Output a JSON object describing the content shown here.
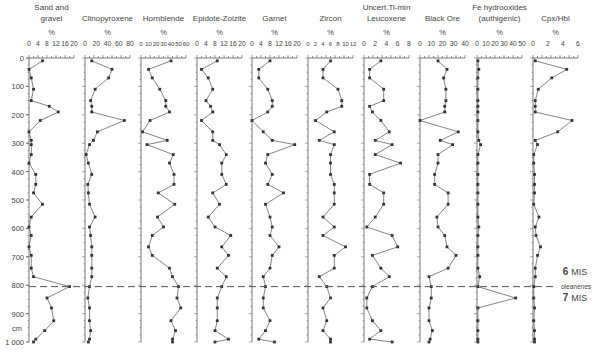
{
  "chart_data": {
    "type": "line",
    "title": "",
    "ylabel": "cm",
    "y_axis": {
      "min": 0,
      "max": 1000,
      "ticks": [
        0,
        100,
        200,
        300,
        400,
        500,
        600,
        700,
        800,
        900,
        "1 000"
      ]
    },
    "depths": [
      10,
      40,
      70,
      110,
      150,
      170,
      190,
      220,
      260,
      290,
      305,
      340,
      370,
      410,
      445,
      475,
      515,
      560,
      595,
      625,
      665,
      695,
      740,
      770,
      805,
      845,
      880,
      925,
      960,
      990,
      1000
    ],
    "panels": [
      {
        "name": "Sand and gravel",
        "title_lines": [
          "Sand and",
          "gravel"
        ],
        "unit": "%",
        "xlim": [
          0,
          20
        ],
        "ticks": [
          "0",
          "4",
          "8",
          "12",
          "16",
          "20"
        ],
        "values": [
          6,
          0,
          1,
          2,
          1,
          9,
          13,
          5,
          0,
          1,
          1,
          1,
          0,
          3,
          3,
          2,
          6,
          1,
          0,
          1,
          0,
          1,
          1,
          2,
          18,
          8,
          10,
          11,
          7,
          3,
          2,
          1
        ]
      },
      {
        "name": "Clinopyroxene",
        "title_lines": [
          "Clinopyroxene"
        ],
        "unit": "%",
        "xlim": [
          0,
          80
        ],
        "ticks": [
          "0",
          "20",
          "40",
          "60",
          "80"
        ],
        "values": [
          12,
          48,
          42,
          18,
          10,
          12,
          12,
          70,
          22,
          15,
          8,
          2,
          6,
          12,
          5,
          6,
          8,
          18,
          8,
          10,
          12,
          12,
          12,
          12,
          8,
          5,
          8,
          8,
          10,
          8,
          6,
          6
        ]
      },
      {
        "name": "Hornblende",
        "title_lines": [
          "Hornblende"
        ],
        "unit": "%",
        "xlim": [
          0,
          60
        ],
        "ticks": [
          "0",
          "10",
          "20",
          "30",
          "40",
          "50",
          "60"
        ],
        "values": [
          40,
          10,
          15,
          25,
          33,
          33,
          38,
          12,
          2,
          35,
          8,
          43,
          38,
          44,
          44,
          23,
          45,
          22,
          30,
          15,
          10,
          15,
          38,
          42,
          50,
          48,
          53,
          40,
          46,
          42,
          42
        ]
      },
      {
        "name": "Epidote-Zoizite",
        "title_lines": [
          "Epidote-Zoizite"
        ],
        "unit": "%",
        "xlim": [
          0,
          20
        ],
        "ticks": [
          "0",
          "4",
          "8",
          "12",
          "16",
          "20"
        ],
        "values": [
          9,
          2,
          5,
          7,
          4,
          6,
          7,
          2,
          7,
          7,
          10,
          13,
          11,
          11,
          13,
          7,
          10,
          5,
          8,
          15,
          11,
          14,
          9,
          13,
          11,
          9,
          9,
          9,
          8,
          14,
          8
        ]
      },
      {
        "name": "Garnet",
        "title_lines": [
          "Garnet"
        ],
        "unit": "%",
        "xlim": [
          0,
          20
        ],
        "ticks": [
          "0",
          "4",
          "8",
          "12",
          "16",
          "20"
        ],
        "values": [
          8,
          3,
          3,
          7,
          9,
          9,
          7,
          0,
          5,
          9,
          19,
          7,
          6,
          9,
          7,
          14,
          6,
          8,
          9,
          8,
          12,
          9,
          8,
          5,
          6,
          5,
          5,
          8,
          6,
          3,
          10
        ]
      },
      {
        "name": "Zircon",
        "title_lines": [
          "Zircon"
        ],
        "unit": "%",
        "xlim": [
          0,
          12
        ],
        "ticks": [
          "0",
          "2",
          "4",
          "6",
          "8",
          "10",
          "12"
        ],
        "values": [
          6,
          4,
          4,
          8,
          9,
          9,
          5,
          2,
          7,
          3,
          7,
          6,
          6,
          6,
          7,
          7,
          7,
          4,
          7,
          4,
          10,
          7,
          7,
          3,
          5,
          6,
          4,
          5,
          4,
          6,
          6
        ]
      },
      {
        "name": "Uncert.Ti-min Leucoxene",
        "title_lines": [
          "Uncert.Ti-min",
          "Leucoxene"
        ],
        "unit": "%",
        "xlim": [
          0,
          8
        ],
        "ticks": [
          "0",
          "2",
          "4",
          "6",
          "8"
        ],
        "values": [
          3,
          1,
          1,
          3.5,
          3.5,
          1,
          1.5,
          3,
          4.5,
          2,
          5,
          2,
          6.5,
          1,
          1,
          3.5,
          3.5,
          2,
          0.5,
          5,
          6,
          1.5,
          3,
          4.5,
          1.5,
          0.5,
          0.5,
          1.5,
          3,
          1,
          5,
          2
        ]
      },
      {
        "name": "Black Ore",
        "title_lines": [
          "Black Ore"
        ],
        "unit": "%",
        "xlim": [
          0,
          40
        ],
        "ticks": [
          "0",
          "10",
          "20",
          "30",
          "40"
        ],
        "values": [
          16,
          24,
          21,
          23,
          23,
          22,
          22,
          0,
          34,
          18,
          29,
          16,
          16,
          13,
          13,
          25,
          25,
          15,
          16,
          22,
          24,
          32,
          25,
          8,
          10,
          10,
          8,
          8,
          11,
          9,
          8,
          7
        ]
      },
      {
        "name": "Fe hydrooxides (authigenic)",
        "title_lines": [
          "Fe hydrooxides",
          "(authigenic)"
        ],
        "unit": "%",
        "xlim": [
          0,
          50
        ],
        "ticks": [
          "0",
          "10",
          "20",
          "30",
          "40",
          "50"
        ],
        "values": [
          1,
          2,
          1,
          1,
          1,
          1,
          1,
          1,
          1,
          2,
          4,
          1,
          1,
          1,
          1,
          1,
          1,
          1,
          2,
          1,
          1,
          1,
          1,
          3,
          1,
          43,
          1,
          1,
          1,
          1,
          1,
          2,
          1
        ]
      },
      {
        "name": "Cpx/Hbl",
        "title_lines": [
          "Cpx/Hbl"
        ],
        "unit": "",
        "xlim": [
          0,
          6
        ],
        "ticks": [
          "0",
          "2",
          "4",
          "6"
        ],
        "values": [
          0.3,
          4.5,
          2.5,
          0.7,
          0.3,
          0.3,
          0.3,
          5.2,
          3.3,
          0.3,
          0.6,
          0.1,
          0.1,
          0.2,
          0.2,
          0.2,
          0.1,
          0.8,
          0.3,
          0.4,
          1.0,
          0.6,
          0.3,
          0.3,
          0.1,
          0.1,
          0.2,
          0.1,
          0.2,
          0.2,
          0.2
        ]
      }
    ],
    "annotations": {
      "boundary_depth": 805,
      "upper_label": {
        "num": "6",
        "text": "MIS"
      },
      "middle_label": "oleanenes",
      "lower_label": {
        "num": "7",
        "text": "MIS"
      }
    },
    "grid": false,
    "legend": null
  }
}
